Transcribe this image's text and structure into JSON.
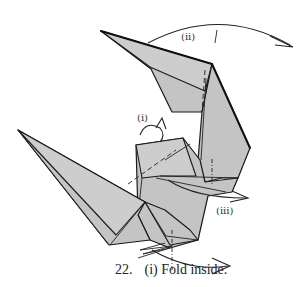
{
  "diagram": {
    "step_number": "22.",
    "caption": "(i) Fold inside.",
    "labels": {
      "i": "(i)",
      "ii": "(ii)",
      "iii": "(iii)"
    },
    "colors": {
      "paper": "#c4c4c4",
      "line": "#1a1a1a",
      "background": "#ffffff"
    }
  }
}
